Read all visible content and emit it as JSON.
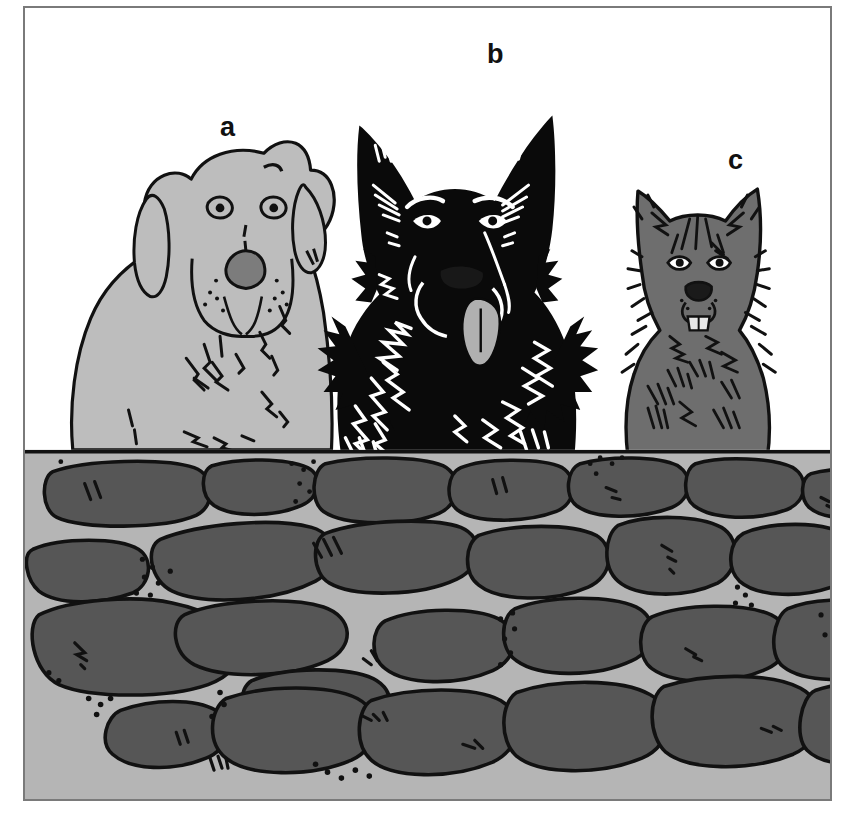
{
  "figure": {
    "background_color": "#ffffff",
    "frame": {
      "border_color": "#7a7a7a",
      "border_width_px": 2,
      "x": 23,
      "y": 6,
      "width": 809,
      "height": 795
    }
  },
  "labels": [
    {
      "id": "a",
      "text": "a",
      "x": 195,
      "y": 106,
      "subject": "light-coated dog, left"
    },
    {
      "id": "b",
      "text": "b",
      "x": 462,
      "y": 33,
      "subject": "black dog, centre"
    },
    {
      "id": "c",
      "text": "c",
      "x": 703,
      "y": 139,
      "subject": "dark grey shaggy dog, right"
    }
  ],
  "subjects": [
    {
      "id": "a",
      "name": "labrador-retriever",
      "coat_color": "#bdbdbd",
      "outline_color": "#111111",
      "nose_color": "#7c7c7c",
      "position": "left",
      "relative_size": "large",
      "features": [
        "floppy ears",
        "broad muzzle",
        "whisker dots",
        "chest fur strokes"
      ]
    },
    {
      "id": "b",
      "name": "black-german-shepherd",
      "coat_color": "#0a0a0a",
      "outline_color": "#0a0a0a",
      "highlight_color": "#ffffff",
      "tongue_color": "#b0b0b0",
      "position": "centre",
      "relative_size": "largest",
      "features": [
        "erect pointed ears",
        "tongue out",
        "white fur highlights",
        "shaggy ruff"
      ]
    },
    {
      "id": "c",
      "name": "shaggy-terrier-mix",
      "coat_color": "#6e6e6e",
      "outline_color": "#111111",
      "nose_color": "#1a1a1a",
      "teeth_color": "#e8e8e8",
      "position": "right",
      "relative_size": "small",
      "features": [
        "erect tufted ears",
        "shaggy coat",
        "visible lower teeth",
        "fur hatching"
      ]
    }
  ],
  "wall": {
    "name": "drystone-wall",
    "mortar_color": "#b5b5b5",
    "stone_color": "#565656",
    "stone_outline_color": "#111111",
    "pebble_color": "#111111",
    "top_edge_y": 450,
    "stone_rows": 4,
    "approx_stone_count": 28
  },
  "palette": {
    "white": "#ffffff",
    "light_gray": "#bdbdbd",
    "mid_gray": "#b5b5b5",
    "stone_gray": "#565656",
    "dark_gray": "#6e6e6e",
    "black": "#0a0a0a",
    "frame_gray": "#7a7a7a"
  }
}
